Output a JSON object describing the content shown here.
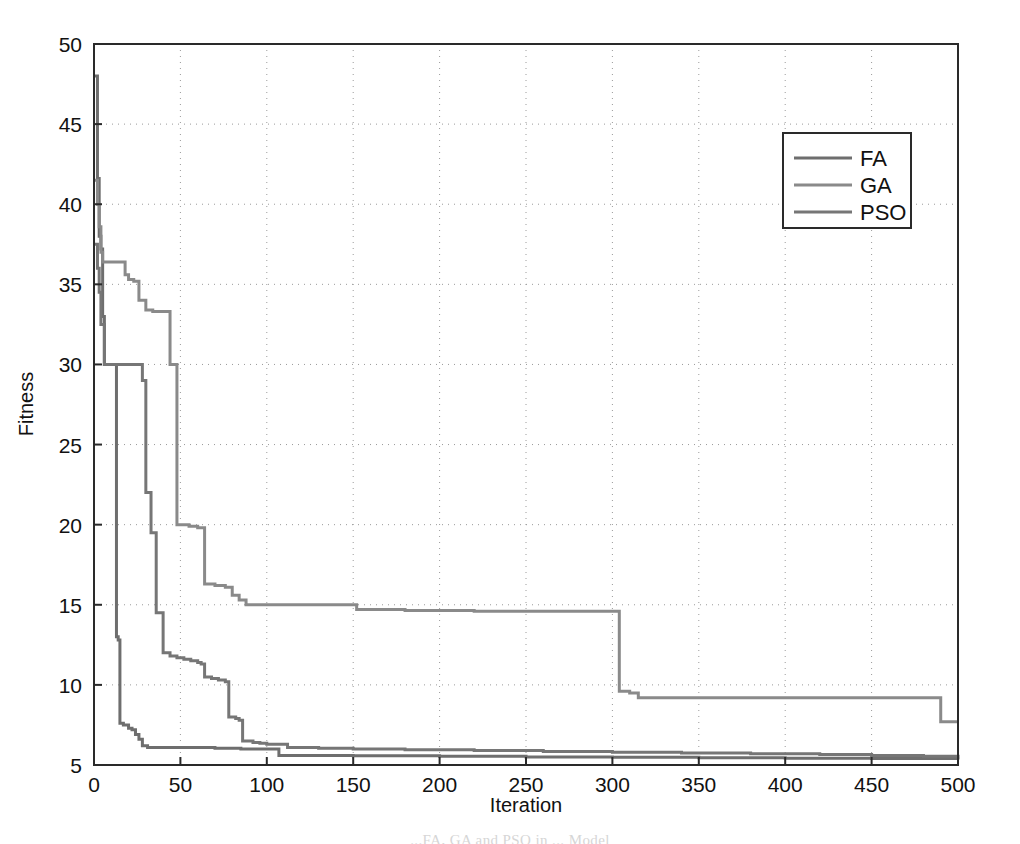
{
  "figure": {
    "background_color": "#ffffff",
    "plot_frame_color": "#2a2a2a",
    "grid_color": "#9a9a9a",
    "caption": "...FA, GA and PSO in ... Model"
  },
  "chart_data": {
    "type": "line",
    "title": "",
    "xlabel": "Iteration",
    "ylabel": "Fitness",
    "xlim": [
      0,
      500
    ],
    "ylim": [
      5,
      50
    ],
    "xticks": [
      0,
      50,
      100,
      150,
      200,
      250,
      300,
      350,
      400,
      450,
      500
    ],
    "yticks": [
      5,
      10,
      15,
      20,
      25,
      30,
      35,
      40,
      45,
      50
    ],
    "xtick_labels": [
      "0",
      "50",
      "100",
      "150",
      "200",
      "250",
      "300",
      "350",
      "400",
      "450",
      "500"
    ],
    "ytick_labels": [
      "5",
      "10",
      "15",
      "20",
      "25",
      "30",
      "35",
      "40",
      "45",
      "50"
    ],
    "grid": true,
    "grid_style": "dotted",
    "legend_position": "upper right",
    "legend_entries": [
      "FA",
      "GA",
      "PSO"
    ],
    "series": [
      {
        "name": "FA",
        "color": "#6e6e6e",
        "line_width": 3,
        "points": [
          [
            0,
            48.0
          ],
          [
            1,
            48.0
          ],
          [
            2,
            41.6
          ],
          [
            3,
            38.0
          ],
          [
            4,
            37.2
          ],
          [
            5,
            33.0
          ],
          [
            6,
            30.0
          ],
          [
            8,
            30.0
          ],
          [
            10,
            30.0
          ],
          [
            12,
            30.0
          ],
          [
            13,
            13.0
          ],
          [
            14,
            12.8
          ],
          [
            15,
            7.6
          ],
          [
            17,
            7.5
          ],
          [
            20,
            7.3
          ],
          [
            22,
            7.2
          ],
          [
            24,
            6.9
          ],
          [
            26,
            6.6
          ],
          [
            28,
            6.2
          ],
          [
            31,
            6.1
          ],
          [
            40,
            6.1
          ],
          [
            55,
            6.1
          ],
          [
            70,
            6.05
          ],
          [
            85,
            6.0
          ],
          [
            95,
            6.0
          ],
          [
            100,
            6.0
          ],
          [
            104,
            6.0
          ],
          [
            107,
            5.6
          ],
          [
            120,
            5.6
          ],
          [
            150,
            5.58
          ],
          [
            200,
            5.55
          ],
          [
            250,
            5.5
          ],
          [
            300,
            5.48
          ],
          [
            350,
            5.45
          ],
          [
            400,
            5.42
          ],
          [
            450,
            5.4
          ],
          [
            500,
            5.35
          ]
        ]
      },
      {
        "name": "GA",
        "color": "#8a8a8a",
        "line_width": 3,
        "points": [
          [
            0,
            41.5
          ],
          [
            1,
            41.5
          ],
          [
            2,
            40.0
          ],
          [
            3,
            38.6
          ],
          [
            4,
            37.0
          ],
          [
            5,
            36.4
          ],
          [
            10,
            36.4
          ],
          [
            16,
            36.4
          ],
          [
            18,
            35.6
          ],
          [
            20,
            35.3
          ],
          [
            23,
            35.2
          ],
          [
            26,
            34.0
          ],
          [
            30,
            33.4
          ],
          [
            34,
            33.3
          ],
          [
            40,
            33.3
          ],
          [
            44,
            30.0
          ],
          [
            46,
            30.0
          ],
          [
            48,
            20.0
          ],
          [
            55,
            19.9
          ],
          [
            60,
            19.8
          ],
          [
            62,
            19.8
          ],
          [
            64,
            16.3
          ],
          [
            70,
            16.2
          ],
          [
            76,
            16.1
          ],
          [
            80,
            15.6
          ],
          [
            84,
            15.3
          ],
          [
            88,
            15.0
          ],
          [
            100,
            15.0
          ],
          [
            120,
            15.0
          ],
          [
            140,
            15.0
          ],
          [
            150,
            15.0
          ],
          [
            152,
            14.7
          ],
          [
            180,
            14.65
          ],
          [
            220,
            14.6
          ],
          [
            260,
            14.6
          ],
          [
            300,
            14.6
          ],
          [
            303,
            14.6
          ],
          [
            304,
            9.6
          ],
          [
            310,
            9.5
          ],
          [
            315,
            9.2
          ],
          [
            340,
            9.2
          ],
          [
            380,
            9.2
          ],
          [
            420,
            9.2
          ],
          [
            460,
            9.2
          ],
          [
            487,
            9.2
          ],
          [
            490,
            7.7
          ],
          [
            500,
            7.7
          ]
        ]
      },
      {
        "name": "PSO",
        "color": "#767676",
        "line_width": 3,
        "points": [
          [
            0,
            37.5
          ],
          [
            1,
            37.5
          ],
          [
            2,
            36.0
          ],
          [
            3,
            34.5
          ],
          [
            4,
            32.5
          ],
          [
            6,
            30.0
          ],
          [
            12,
            30.0
          ],
          [
            20,
            30.0
          ],
          [
            26,
            30.0
          ],
          [
            28,
            29.0
          ],
          [
            30,
            22.0
          ],
          [
            33,
            19.5
          ],
          [
            36,
            14.5
          ],
          [
            40,
            12.0
          ],
          [
            44,
            11.8
          ],
          [
            48,
            11.7
          ],
          [
            52,
            11.6
          ],
          [
            56,
            11.5
          ],
          [
            60,
            11.4
          ],
          [
            62,
            11.3
          ],
          [
            64,
            10.5
          ],
          [
            68,
            10.4
          ],
          [
            72,
            10.3
          ],
          [
            76,
            10.2
          ],
          [
            78,
            8.0
          ],
          [
            82,
            7.9
          ],
          [
            84,
            7.8
          ],
          [
            86,
            6.5
          ],
          [
            92,
            6.4
          ],
          [
            96,
            6.35
          ],
          [
            100,
            6.3
          ],
          [
            105,
            6.3
          ],
          [
            110,
            6.3
          ],
          [
            112,
            6.1
          ],
          [
            130,
            6.05
          ],
          [
            150,
            6.0
          ],
          [
            180,
            5.95
          ],
          [
            220,
            5.9
          ],
          [
            260,
            5.85
          ],
          [
            300,
            5.8
          ],
          [
            340,
            5.75
          ],
          [
            380,
            5.7
          ],
          [
            420,
            5.65
          ],
          [
            450,
            5.6
          ],
          [
            480,
            5.55
          ],
          [
            500,
            5.5
          ]
        ]
      }
    ]
  }
}
